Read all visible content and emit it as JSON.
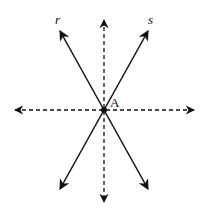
{
  "diagram": {
    "type": "intersecting-lines",
    "point": {
      "label": "A",
      "x": 104,
      "y": 110
    },
    "lines": [
      {
        "name": "r",
        "label": "r",
        "style": "solid",
        "from": [
          59,
          29
        ],
        "to": [
          149,
          191
        ]
      },
      {
        "name": "s",
        "label": "s",
        "style": "solid",
        "from": [
          149,
          29
        ],
        "to": [
          59,
          191
        ]
      },
      {
        "name": "vertical",
        "label": "",
        "style": "dashed",
        "from": [
          104,
          18
        ],
        "to": [
          104,
          204
        ]
      },
      {
        "name": "horizontal",
        "label": "",
        "style": "dashed",
        "from": [
          13,
          110
        ],
        "to": [
          196,
          110
        ]
      }
    ],
    "labels": {
      "r": "r",
      "s": "s",
      "A": "A"
    },
    "colors": {
      "stroke": "#111111",
      "background": "#ffffff"
    }
  }
}
